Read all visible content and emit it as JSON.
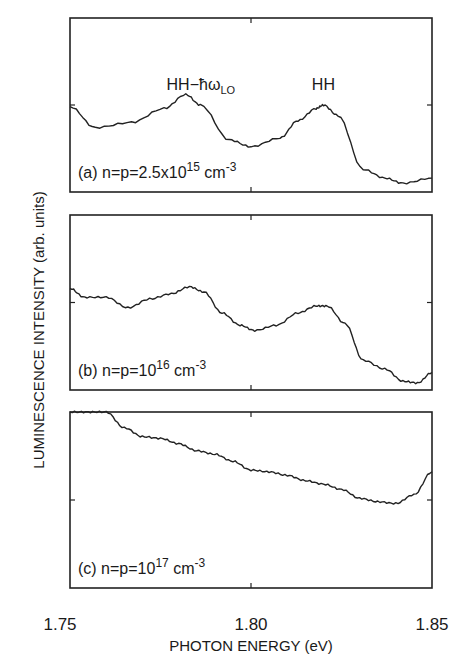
{
  "chart_data": {
    "type": "line",
    "title": "",
    "xlabel": "PHOTON ENERGY (eV)",
    "ylabel": "LUMINESCENCE INTENSITY (arb. units)",
    "xlim": [
      1.75,
      1.85
    ],
    "x_ticks": [
      "1.75",
      "1.80",
      "1.85"
    ],
    "grid": false,
    "legend": "none (panel labels inside each plot)",
    "panels": [
      {
        "id": "a",
        "label": "(a) n=p=2.5x10",
        "label_exp": "15",
        "label_unit": " cm",
        "label_unit_exp": "-3",
        "annotations": [
          {
            "text": "HH−ħω",
            "sub": "LO",
            "x": 1.782
          },
          {
            "text": "HH",
            "x": 1.82
          }
        ],
        "x": [
          1.75,
          1.757,
          1.767,
          1.776,
          1.782,
          1.786,
          1.794,
          1.8,
          1.808,
          1.813,
          1.818,
          1.82,
          1.824,
          1.831,
          1.837,
          1.842,
          1.85
        ],
        "y": [
          0.49,
          0.37,
          0.4,
          0.48,
          0.56,
          0.5,
          0.3,
          0.26,
          0.31,
          0.41,
          0.48,
          0.5,
          0.44,
          0.13,
          0.08,
          0.05,
          0.08
        ]
      },
      {
        "id": "b",
        "label": "(b) n=p=10",
        "label_exp": "16",
        "label_unit": " cm",
        "label_unit_exp": "-3",
        "x": [
          1.75,
          1.754,
          1.76,
          1.766,
          1.772,
          1.778,
          1.783,
          1.787,
          1.792,
          1.797,
          1.801,
          1.807,
          1.813,
          1.818,
          1.821,
          1.826,
          1.831,
          1.837,
          1.842,
          1.846,
          1.85
        ],
        "y": [
          0.58,
          0.53,
          0.53,
          0.47,
          0.52,
          0.55,
          0.59,
          0.56,
          0.44,
          0.37,
          0.34,
          0.37,
          0.44,
          0.48,
          0.48,
          0.38,
          0.17,
          0.12,
          0.05,
          0.04,
          0.1
        ]
      },
      {
        "id": "c",
        "label": "(c) n=p=10",
        "label_exp": "17",
        "label_unit": " cm",
        "label_unit_exp": "-3",
        "x": [
          1.75,
          1.755,
          1.76,
          1.765,
          1.77,
          1.775,
          1.78,
          1.785,
          1.79,
          1.795,
          1.8,
          1.805,
          1.81,
          1.815,
          1.82,
          1.825,
          1.83,
          1.835,
          1.84,
          1.845,
          1.85
        ],
        "y": [
          1.0,
          1.0,
          1.0,
          0.91,
          0.86,
          0.85,
          0.82,
          0.78,
          0.76,
          0.72,
          0.67,
          0.66,
          0.64,
          0.61,
          0.59,
          0.56,
          0.51,
          0.49,
          0.48,
          0.53,
          0.66
        ]
      }
    ]
  },
  "axes": {
    "xlabel": "PHOTON ENERGY (eV)",
    "ylabel": "LUMINESCENCE INTENSITY (arb. units)",
    "ticks": [
      "1.75",
      "1.80",
      "1.85"
    ]
  }
}
